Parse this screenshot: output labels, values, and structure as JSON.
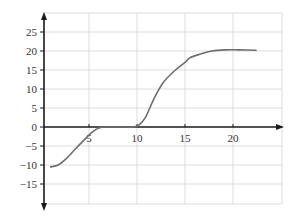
{
  "chart_data": {
    "type": "line",
    "title": "",
    "xlabel": "",
    "ylabel": "",
    "xlim": [
      0,
      25
    ],
    "ylim": [
      -20,
      30
    ],
    "grid": true,
    "legend": "none",
    "x_ticks": [
      5,
      10,
      15,
      20
    ],
    "x_tick_labels": [
      "5",
      "10",
      "15",
      "20"
    ],
    "y_ticks": [
      25,
      20,
      15,
      10,
      5,
      0,
      -5,
      -10,
      -15
    ],
    "y_tick_labels": [
      "25",
      "20",
      "15",
      "10",
      "5",
      "0",
      "−5",
      "−10",
      "−15"
    ],
    "series": [
      {
        "name": "curve",
        "color": "#6e6e6e",
        "x": [
          1,
          1.8,
          2.6,
          3.5,
          4.5,
          5.3,
          6.1,
          7,
          8,
          9,
          9.6,
          10.2,
          10.9,
          11.7,
          12.7,
          14,
          15,
          15.5,
          16.6,
          17.8,
          19.2,
          20.5,
          22.4
        ],
        "y": [
          -10.5,
          -10,
          -8.4,
          -6,
          -3.4,
          -1.4,
          -0.2,
          0,
          0,
          0,
          0,
          0.5,
          2.6,
          7.1,
          11.6,
          15,
          17,
          18.2,
          19.2,
          20,
          20.3,
          20.3,
          20.2
        ]
      }
    ]
  }
}
